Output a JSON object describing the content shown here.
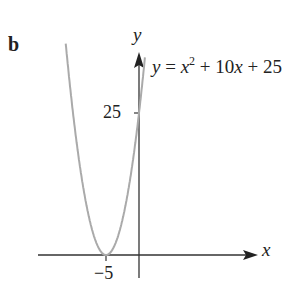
{
  "panel_label": "b",
  "chart_data": {
    "type": "line",
    "title": "",
    "equation": "y = x^2 + 10x + 25",
    "xlabel": "x",
    "ylabel": "y",
    "x_ticks": [
      {
        "value": -5,
        "label": "−5"
      }
    ],
    "y_ticks": [
      {
        "value": 25,
        "label": "25"
      }
    ],
    "series": [
      {
        "name": "y = x^2 + 10x + 25",
        "color": "#aaaaaa",
        "points": [
          [
            -11,
            36
          ],
          [
            -10,
            25
          ],
          [
            -9,
            16
          ],
          [
            -8,
            9
          ],
          [
            -7,
            4
          ],
          [
            -6,
            1
          ],
          [
            -5,
            0
          ],
          [
            -4,
            1
          ],
          [
            -3,
            4
          ],
          [
            -2,
            9
          ],
          [
            -1,
            16
          ],
          [
            0,
            25
          ],
          [
            1,
            36
          ]
        ]
      }
    ],
    "vertex": [
      -5,
      0
    ],
    "y_intercept": 25,
    "grid": false,
    "legend": "none"
  },
  "labels": {
    "y_axis": "y",
    "x_axis": "x",
    "eq_y": "y",
    "eq_eq": " = ",
    "eq_x": "x",
    "eq_exp": "2",
    "eq_mid": " + 10",
    "eq_x2": "x",
    "eq_end": " + 25",
    "tick_25": "25",
    "tick_m5": "−5"
  }
}
